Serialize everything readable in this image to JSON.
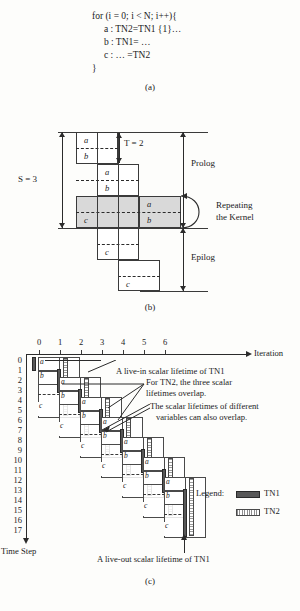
{
  "figure": {
    "panel_a": {
      "caption": "(a)",
      "code_lines": [
        "for (i = 0; i < N; i++){",
        "     a : TN2=TN1 {1}…",
        "     b : TN1= …",
        "     c : … =TN2",
        "}"
      ]
    },
    "panel_b": {
      "caption": "(b)",
      "labels": {
        "s": "S = 3",
        "t": "T = 2",
        "prolog": "Prolog",
        "kernel_line1": "Repeating",
        "kernel_line2": "the Kernel",
        "epilog": "Epilog"
      },
      "stage_rows": [
        {
          "stage": 0,
          "ops": [
            "a",
            "b"
          ]
        },
        {
          "stage": 1,
          "ops": [
            "a",
            "b"
          ]
        },
        {
          "stage": 2,
          "ops": [
            "c",
            "a",
            "b"
          ],
          "kernel": true
        },
        {
          "stage": 3,
          "ops": [
            "c"
          ]
        },
        {
          "stage": 4,
          "ops": [
            "c"
          ]
        }
      ],
      "op_names": [
        "a",
        "b",
        "c"
      ]
    },
    "panel_c": {
      "caption": "(c)",
      "axis": {
        "x_label": "Iteration",
        "y_label": "Time Step",
        "iterations": [
          "0",
          "1",
          "2",
          "3",
          "4",
          "5",
          "6"
        ],
        "time_steps": [
          "0",
          "1",
          "2",
          "3",
          "4",
          "5",
          "6",
          "7",
          "8",
          "9",
          "10",
          "11",
          "12",
          "13",
          "14",
          "15",
          "16",
          "17"
        ]
      },
      "annotations": [
        {
          "id": "live-in",
          "text": "A live-in scalar lifetime of TN1"
        },
        {
          "id": "tn2-overlap",
          "text": "For TN2, the three scalar\nlifetimes overlap."
        },
        {
          "id": "diff-vars-overlap",
          "text": "The scalar lifetimes of different\nvariables can also overlap."
        },
        {
          "id": "live-out",
          "text": "A live-out scalar lifetime of TN1"
        }
      ],
      "legend": {
        "title": "Legend:",
        "entries": [
          {
            "name": "TN1",
            "style": "solid-dark"
          },
          {
            "name": "TN2",
            "style": "hatched"
          }
        ]
      },
      "iteration_blocks": [
        {
          "iteration": 0,
          "start_time": 0,
          "ops": [
            "a",
            "b",
            "c"
          ]
        },
        {
          "iteration": 1,
          "start_time": 2,
          "ops": [
            "a",
            "b",
            "c"
          ]
        },
        {
          "iteration": 2,
          "start_time": 4,
          "ops": [
            "a",
            "b",
            "c"
          ]
        },
        {
          "iteration": 3,
          "start_time": 6,
          "ops": [
            "a",
            "b",
            "c"
          ]
        },
        {
          "iteration": 4,
          "start_time": 8,
          "ops": [
            "a",
            "b",
            "c"
          ]
        },
        {
          "iteration": 5,
          "start_time": 10,
          "ops": [
            "a",
            "b",
            "c"
          ]
        },
        {
          "iteration": 6,
          "start_time": 12,
          "ops": [
            "a",
            "b",
            "c"
          ]
        }
      ]
    }
  }
}
